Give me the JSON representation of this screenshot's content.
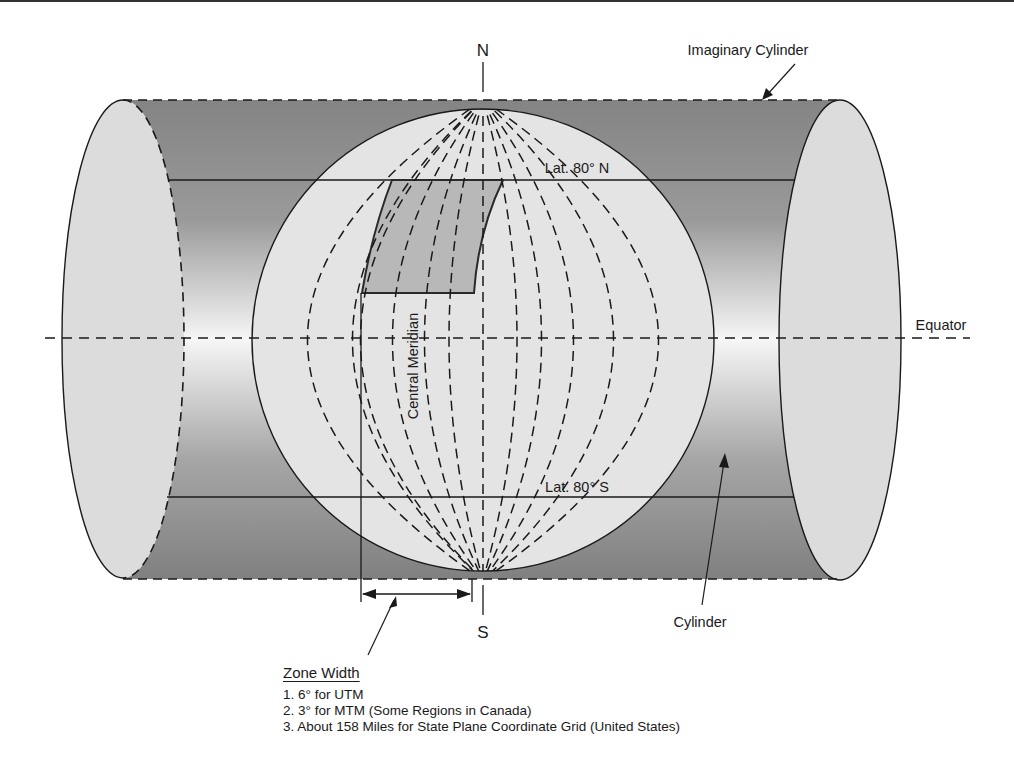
{
  "figure": {
    "type": "Transverse Mercator cylinder projection diagram",
    "labels": {
      "north": "N",
      "south": "S",
      "imaginary_cylinder": "Imaginary Cylinder",
      "lat_north": "Lat. 80° N",
      "lat_south": "Lat. 80° S",
      "equator": "Equator",
      "central_meridian": "Central Meridian",
      "cylinder": "Cylinder"
    },
    "zone_width": {
      "title": "Zone Width",
      "items": [
        "1. 6° for UTM",
        "2. 3° for MTM (Some Regions in Canada)",
        "3. About 158 Miles for State Plane Coordinate Grid (United States)"
      ]
    },
    "colors": {
      "cylinder_dark": "#8a8a8a",
      "cylinder_light": "#f4f4f4",
      "ellipse_fill": "#dcdcdc",
      "globe_fill": "#e4e4e4",
      "zone_fill": "#b8b8b8",
      "line": "#1a1a1a"
    }
  }
}
